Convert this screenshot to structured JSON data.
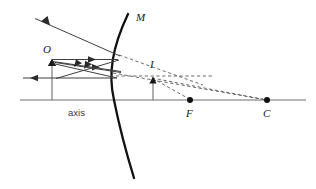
{
  "figure": {
    "background": "#ffffff",
    "stroke_dark": "#1a1a1a",
    "stroke_ray": "#4a4a4a",
    "stroke_axis": "#6e6e6e",
    "stroke_dashed": "#5a5a5a",
    "width": 316,
    "height": 189
  },
  "labels": {
    "mirror": "M",
    "object": "O",
    "image": "I",
    "focus": "F",
    "centre": "C",
    "axis": "axis"
  },
  "geometry": {
    "axis": {
      "x1": 20,
      "y1": 100,
      "x2": 306,
      "y2": 100
    },
    "mirror_vertex": {
      "x": 114,
      "y": 100
    },
    "object_base": {
      "x": 52,
      "y": 100
    },
    "object_tip": {
      "x": 52,
      "y": 60
    },
    "image_base": {
      "x": 153,
      "y": 100
    },
    "image_tip": {
      "x": 153,
      "y": 78
    },
    "focus_point": {
      "x": 190,
      "y": 100
    },
    "centre_point": {
      "x": 267,
      "y": 100
    },
    "dot_radius": 2.6
  },
  "label_positions": {
    "mirror": {
      "x": 136,
      "y": 21
    },
    "object": {
      "x": 43,
      "y": 53
    },
    "image": {
      "x": 150,
      "y": 67
    },
    "focus": {
      "x": 186,
      "y": 116
    },
    "centre": {
      "x": 263,
      "y": 116
    },
    "axis": {
      "x": 68,
      "y": 115
    }
  },
  "rays": [
    {
      "name": "parallel-ray-from-object-to-mirror",
      "style": "solid",
      "arrow": "mid",
      "points": "52,60 118,60"
    },
    {
      "name": "reflected-ray-through-focus",
      "style": "solid",
      "arrow": "mid-back",
      "points": "118,60 55,79"
    },
    {
      "name": "ray-object-to-mirror-lower",
      "style": "solid",
      "arrow": "mid",
      "points": "52,62 120,72"
    },
    {
      "name": "reflected-ray-back-left",
      "style": "solid",
      "arrow": "mid-back",
      "points": "120,72 54,63"
    },
    {
      "name": "incident-ray-to-vertex",
      "style": "solid",
      "arrow": "none",
      "points": "52,63 116,78"
    },
    {
      "name": "reflected-ray-up-left",
      "style": "solid",
      "arrow": "mid-back",
      "points": "120,56 34,18"
    },
    {
      "name": "axis-parallel-ray-leftward",
      "style": "solid",
      "arrow": "mid-back",
      "points": "116,78 22,78"
    }
  ],
  "dashed_lines": [
    {
      "name": "virtual-extension-mirror-to-image-upper",
      "points": "119,55 200,84"
    },
    {
      "name": "virtual-extension-image-to-centre",
      "points": "153,78 267,100"
    },
    {
      "name": "virtual-extension-mirror-to-centre",
      "points": "114,72 267,100"
    },
    {
      "name": "virtual-horizontal-from-image",
      "points": "110,76 212,76"
    },
    {
      "name": "virtual-line-image-to-focus",
      "points": "153,78 190,100"
    }
  ],
  "mirror_arc": {
    "name": "concave-mirror-surface",
    "path": "M 128,14 C 112,48 108,74 114,100 C 120,130 126,152 134,178"
  }
}
